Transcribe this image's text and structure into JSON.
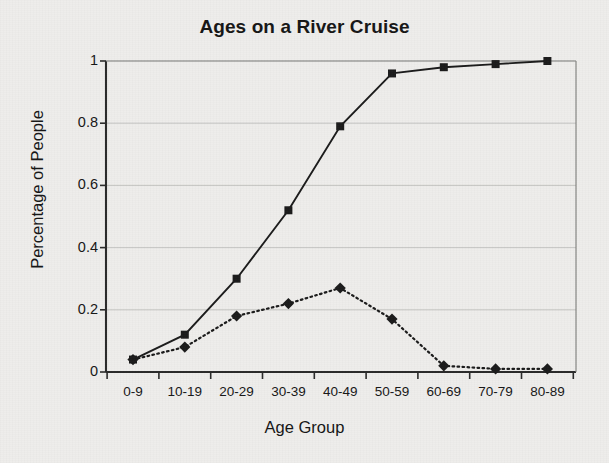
{
  "chart_data": {
    "type": "line",
    "title": "Ages on a River Cruise",
    "xlabel": "Age Group",
    "ylabel": "Percentage of People",
    "categories": [
      "0-9",
      "10-19",
      "20-29",
      "30-39",
      "40-49",
      "50-59",
      "60-69",
      "70-79",
      "80-89"
    ],
    "series": [
      {
        "name": "cumulative",
        "marker": "square",
        "linestyle": "solid",
        "color": "#1a1a1a",
        "values": [
          0.04,
          0.12,
          0.3,
          0.52,
          0.79,
          0.96,
          0.98,
          0.99,
          1.0
        ]
      },
      {
        "name": "relative-frequency",
        "marker": "diamond",
        "linestyle": "dotted",
        "color": "#1a1a1a",
        "values": [
          0.04,
          0.08,
          0.18,
          0.22,
          0.27,
          0.17,
          0.02,
          0.01,
          0.01
        ]
      }
    ],
    "ylim": [
      0,
      1
    ],
    "yticks": [
      0,
      0.2,
      0.4,
      0.6,
      0.8,
      1
    ],
    "ytick_labels": [
      "0",
      "0.2",
      "0.4",
      "0.6",
      "0.8",
      "1"
    ],
    "grid": true,
    "legend": "none",
    "background": "#eeedeb"
  }
}
